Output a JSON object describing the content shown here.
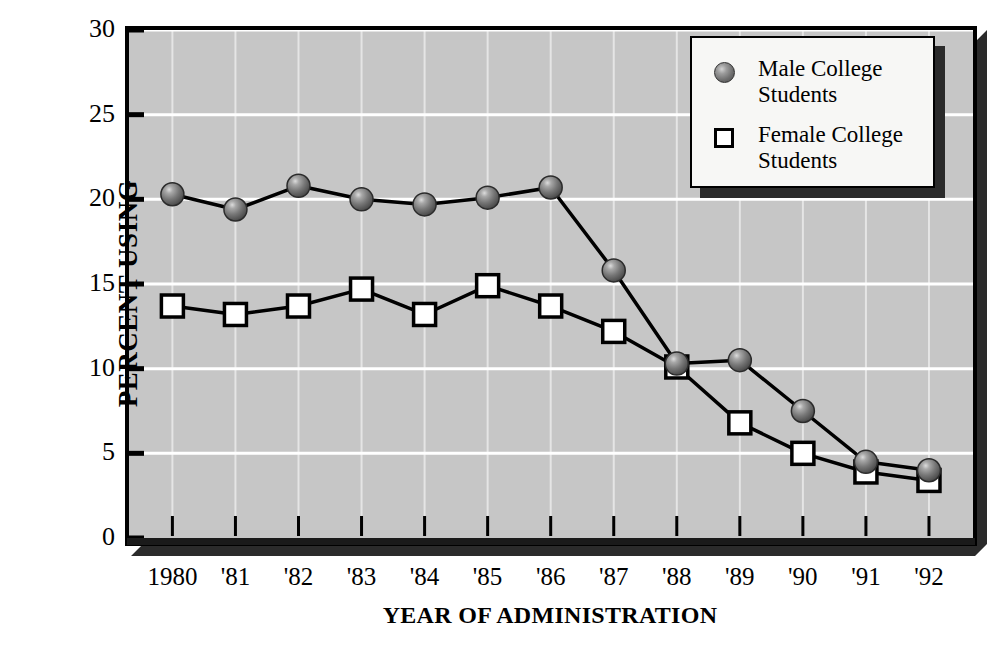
{
  "chart_data": {
    "type": "line",
    "title": "",
    "xlabel": "YEAR OF ADMINISTRATION",
    "ylabel": "PERCENT USING",
    "categories": [
      "1980",
      "'81",
      "'82",
      "'83",
      "'84",
      "'85",
      "'86",
      "'87",
      "'88",
      "'89",
      "'90",
      "'91",
      "'92"
    ],
    "x": [
      1980,
      1981,
      1982,
      1983,
      1984,
      1985,
      1986,
      1987,
      1988,
      1989,
      1990,
      1991,
      1992
    ],
    "ylim": [
      0,
      30
    ],
    "yticks": [
      0,
      5,
      10,
      15,
      20,
      25,
      30
    ],
    "ytick_labels": [
      "0",
      "5",
      "10",
      "15",
      "20",
      "25",
      "30"
    ],
    "grid": true,
    "grid_color": "#ffffff",
    "plot_bg": "#c6c6c6",
    "legend_position": "top-right",
    "series": [
      {
        "name": "Male College\nStudents",
        "marker": "filled-sphere",
        "color": "#6e6e6e",
        "values": [
          20.3,
          19.4,
          20.8,
          20.0,
          19.7,
          20.1,
          20.7,
          15.8,
          10.3,
          10.5,
          7.5,
          4.5,
          4.0
        ]
      },
      {
        "name": "Female College\nStudents",
        "marker": "open-square",
        "color": "#ffffff",
        "values": [
          13.7,
          13.2,
          13.7,
          14.7,
          13.2,
          14.9,
          13.7,
          12.2,
          10.1,
          6.8,
          5.0,
          3.9,
          3.4
        ]
      }
    ]
  },
  "legend": {
    "items": [
      {
        "label": "Male College\nStudents",
        "marker": "filled-sphere"
      },
      {
        "label": "Female College\nStudents",
        "marker": "open-square"
      }
    ]
  },
  "axes": {
    "y_title": "PERCENT USING",
    "x_title": "YEAR OF ADMINISTRATION"
  }
}
